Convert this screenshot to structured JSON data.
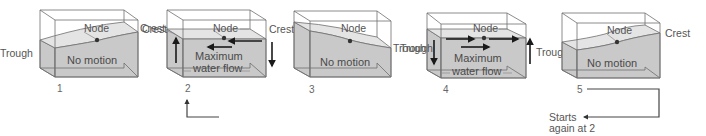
{
  "figure": {
    "colors": {
      "water": "#c9c9c9",
      "water_surface": "#e4e4e4",
      "box_edge": "#6e6e6e",
      "arrow": "#1a1a1a",
      "label": "#555555"
    },
    "panels": [
      {
        "number": "1",
        "labels": {
          "left": "Trough",
          "node": "Node",
          "right": "Crest",
          "center": "No motion"
        },
        "state": "left trough, right crest, no motion"
      },
      {
        "number": "2",
        "labels": {
          "left": "Crest",
          "node": "Node",
          "right": "Crest",
          "center_line1": "Maximum",
          "center_line2": "water flow"
        },
        "state": "level surface, maximum flow to the left"
      },
      {
        "number": "3",
        "labels": {
          "node": "Node",
          "right": "Trough",
          "center": "No motion"
        },
        "state": "left crest, right trough, no motion"
      },
      {
        "number": "4",
        "labels": {
          "left": "Trough",
          "node": "Node",
          "right": "Trough",
          "center_line1": "Maximum",
          "center_line2": "water flow"
        },
        "state": "level surface, maximum flow to the right"
      },
      {
        "number": "5",
        "labels": {
          "node": "Node",
          "right": "Crest",
          "center": "No motion"
        },
        "state": "left trough, right crest, no motion"
      }
    ],
    "loop": {
      "line1": "Starts",
      "line2": "again at 2"
    }
  }
}
